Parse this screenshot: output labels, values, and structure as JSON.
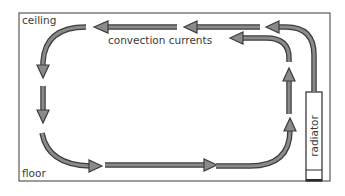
{
  "diagram": {
    "title": "",
    "labels": {
      "ceiling": "ceiling",
      "floor": "floor",
      "convection": "convection currents",
      "radiator": "radiator"
    },
    "colors": {
      "arrow_fill": "#8a8a8a",
      "arrow_outline": "#3c3c3c",
      "room_outline": "#3a3a3a",
      "text": "#3a3a3a",
      "background": "#ffffff"
    },
    "elements": [
      {
        "id": "room",
        "type": "rectangle",
        "description": "room cross-section"
      },
      {
        "id": "radiator",
        "type": "rectangle",
        "description": "radiator on right wall"
      },
      {
        "id": "flow",
        "type": "arrows",
        "description": "convection currents rising from radiator, crossing ceiling leftward, descending left wall, crossing floor rightward, rising back"
      }
    ]
  }
}
